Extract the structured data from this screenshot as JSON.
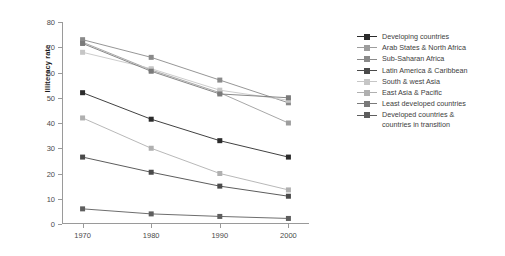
{
  "chart_data": {
    "type": "line",
    "title": "",
    "xlabel": "",
    "ylabel": "Illiteracy rate",
    "x": [
      1970,
      1980,
      1990,
      2000
    ],
    "xticklabels": [
      "1970",
      "1980",
      "1990",
      "2000"
    ],
    "yticklabels": [
      "0",
      "10",
      "20",
      "30",
      "40",
      "50",
      "60",
      "70",
      "80"
    ],
    "ylim": [
      0,
      80
    ],
    "xlim": [
      1967,
      2003
    ],
    "ytick_step": 10,
    "grid": false,
    "legend_position": "right",
    "marker": "square",
    "series": [
      {
        "name": "Developing countries",
        "values": [
          52,
          41.5,
          33,
          26.5
        ],
        "color": "#2b2b2b"
      },
      {
        "name": "Arab States & North Africa",
        "values": [
          72,
          61,
          52,
          40
        ],
        "color": "#9d9d9d"
      },
      {
        "name": "Sub-Saharan Africa",
        "values": [
          73,
          66,
          57,
          48
        ],
        "color": "#8a8a8a"
      },
      {
        "name": "Latin America & Caribbean",
        "values": [
          26.5,
          20.5,
          15,
          11
        ],
        "color": "#4a4a4a"
      },
      {
        "name": "South & west Asia",
        "values": [
          68,
          61.5,
          53,
          49
        ],
        "color": "#c6c6c6"
      },
      {
        "name": "East Asia & Pacific",
        "values": [
          42,
          30,
          20,
          13.5
        ],
        "color": "#b0b0b0"
      },
      {
        "name": "Least developed countries",
        "values": [
          71.5,
          60.5,
          51.5,
          50
        ],
        "color": "#7a7a7a"
      },
      {
        "name": "Developed countries &\ncountries in transition",
        "values": [
          6,
          4,
          3,
          2.2
        ],
        "color": "#5e5e5e"
      }
    ]
  }
}
